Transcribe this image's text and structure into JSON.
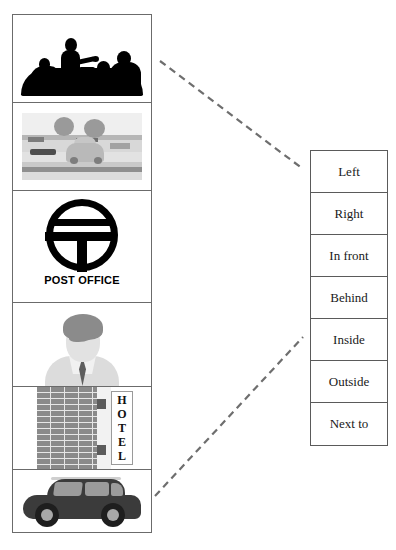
{
  "worksheet": {
    "title": "Prepositions of place matching exercise",
    "image_column": {
      "cells": [
        {
          "id": "meeting",
          "label": "business-meeting-silhouette"
        },
        {
          "id": "street",
          "label": "street-scene-with-car-and-trees"
        },
        {
          "id": "post_office",
          "label": "post-office-logo",
          "caption": "POST OFFICE"
        },
        {
          "id": "person",
          "label": "man-avatar-portrait"
        },
        {
          "id": "hotel",
          "label": "hotel-building-with-sign",
          "sign_text": "HOTEL",
          "sign_letters": [
            "H",
            "O",
            "T",
            "E",
            "L"
          ]
        },
        {
          "id": "car",
          "label": "black-hatchback-car"
        }
      ]
    },
    "word_list": {
      "options": [
        "Left",
        "Right",
        "In front",
        "Behind",
        "Inside",
        "Outside",
        "Next to"
      ]
    },
    "connectors": [
      {
        "from": "meeting",
        "to": "word-list-top",
        "style": "dashed"
      },
      {
        "from": "car",
        "to": "word-list-bottom",
        "style": "dashed"
      }
    ],
    "colors": {
      "border": "#5a5a5a",
      "ink": "#1a1a1a",
      "dash": "#6e6e6e",
      "page": "#ffffff"
    }
  }
}
